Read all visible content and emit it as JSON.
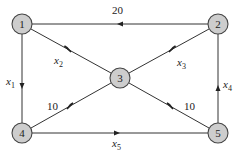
{
  "diagram": {
    "type": "directed-flow-network",
    "colors": {
      "node_fill": "#cdcdcd",
      "node_stroke": "#444444",
      "edge": "#333333",
      "text": "#222222"
    },
    "nodes": [
      {
        "id": "1",
        "label": "1",
        "x": 22,
        "y": 24
      },
      {
        "id": "2",
        "label": "2",
        "x": 218,
        "y": 24
      },
      {
        "id": "3",
        "label": "3",
        "x": 120,
        "y": 78
      },
      {
        "id": "4",
        "label": "4",
        "x": 22,
        "y": 133
      },
      {
        "id": "5",
        "label": "5",
        "x": 218,
        "y": 133
      }
    ],
    "edges": [
      {
        "from": "2",
        "to": "1",
        "label": "20",
        "var": false
      },
      {
        "from": "1",
        "to": "3",
        "label": "x",
        "sub": "2",
        "var": true
      },
      {
        "from": "2",
        "to": "3",
        "label": "x",
        "sub": "3",
        "var": true
      },
      {
        "from": "1",
        "to": "4",
        "label": "x",
        "sub": "1",
        "var": true
      },
      {
        "from": "3",
        "to": "4",
        "label": "10",
        "var": false
      },
      {
        "from": "3",
        "to": "5",
        "label": "10",
        "var": false
      },
      {
        "from": "4",
        "to": "5",
        "label": "x",
        "sub": "5",
        "var": true
      },
      {
        "from": "5",
        "to": "2",
        "label": "x",
        "sub": "4",
        "var": true
      }
    ],
    "labels": {
      "e21": "20",
      "e13_main": "x",
      "e13_sub": "2",
      "e23_main": "x",
      "e23_sub": "3",
      "e14_main": "x",
      "e14_sub": "1",
      "e34": "10",
      "e35": "10",
      "e45_main": "x",
      "e45_sub": "5",
      "e52_main": "x",
      "e52_sub": "4",
      "n1": "1",
      "n2": "2",
      "n3": "3",
      "n4": "4",
      "n5": "5"
    }
  }
}
